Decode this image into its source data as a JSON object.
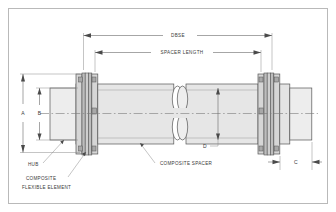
{
  "drawing": {
    "title": "Composite Spacer Coupling Assembly Drawing",
    "border_color": "#b9b9b9",
    "line_color": "#555555",
    "fill_light": "#ededed",
    "fill_mid": "#dcdcdc",
    "fill_dark": "#c6c6c6",
    "text_color": "#3a3a3a"
  },
  "dimensions": {
    "dbse": "DBSE",
    "spacer_length": "SPACER LENGTH",
    "a": "A",
    "b": "B",
    "c": "C",
    "d": "D"
  },
  "callouts": {
    "hub": "HUB",
    "composite_line1": "COMPOSITE",
    "composite_line2": "FLEXIBLE ELEMENT",
    "composite_spacer": "COMPOSITE SPACER"
  }
}
